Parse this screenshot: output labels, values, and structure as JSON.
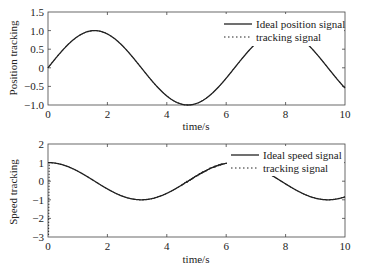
{
  "chart_data": [
    {
      "type": "line",
      "title": "",
      "xlabel": "time/s",
      "ylabel": "Position tracking",
      "xlim": [
        0,
        10
      ],
      "ylim": [
        -1.0,
        1.5
      ],
      "xticks": [
        "0",
        "2",
        "4",
        "6",
        "8",
        "10"
      ],
      "yticks": [
        "1.5",
        "1.0",
        "0.5",
        "0",
        "−0.5",
        "−1.0"
      ],
      "grid": false,
      "legend_position": "upper right",
      "x": [
        0,
        0.5,
        1,
        1.5,
        2,
        2.5,
        3,
        3.5,
        4,
        4.5,
        5,
        5.5,
        6,
        6.5,
        7,
        7.5,
        8,
        8.5,
        9,
        9.5,
        10
      ],
      "series": [
        {
          "name": "Ideal position signal",
          "style": "solid",
          "values": [
            0,
            0.48,
            0.84,
            1.0,
            0.91,
            0.6,
            0.14,
            -0.35,
            -0.76,
            -0.98,
            -0.96,
            -0.71,
            -0.28,
            0.22,
            0.66,
            0.94,
            0.99,
            0.8,
            0.41,
            -0.08,
            -0.54
          ]
        },
        {
          "name": "tracking signal",
          "style": "dotted",
          "values": [
            0,
            0.48,
            0.84,
            1.0,
            0.91,
            0.6,
            0.14,
            -0.35,
            -0.76,
            -0.98,
            -0.96,
            -0.71,
            -0.28,
            0.22,
            0.66,
            0.94,
            0.99,
            0.8,
            0.41,
            -0.08,
            -0.54
          ]
        }
      ]
    },
    {
      "type": "line",
      "title": "",
      "xlabel": "time/s",
      "ylabel": "Speed tracking",
      "xlim": [
        0,
        10
      ],
      "ylim": [
        -3,
        2
      ],
      "xticks": [
        "0",
        "2",
        "4",
        "6",
        "8",
        "10"
      ],
      "yticks": [
        "2",
        "1",
        "0",
        "−1",
        "−2",
        "−3"
      ],
      "grid": false,
      "legend_position": "upper right",
      "x": [
        0,
        0.5,
        1,
        1.5,
        2,
        2.5,
        3,
        3.5,
        4,
        4.5,
        5,
        5.5,
        6,
        6.5,
        7,
        7.5,
        8,
        8.5,
        9,
        9.5,
        10
      ],
      "series": [
        {
          "name": "Ideal speed signal",
          "style": "solid",
          "values": [
            1.0,
            0.88,
            0.54,
            0.07,
            -0.42,
            -0.8,
            -0.99,
            -0.94,
            -0.65,
            -0.21,
            0.28,
            0.71,
            0.96,
            0.98,
            0.75,
            0.35,
            -0.15,
            -0.6,
            -0.91,
            -1.0,
            -0.84
          ]
        },
        {
          "name": "tracking signal",
          "style": "dotted",
          "values": [
            -2.9,
            0.88,
            0.54,
            0.07,
            -0.42,
            -0.8,
            -0.99,
            -0.94,
            -0.65,
            -0.21,
            0.28,
            0.71,
            0.96,
            0.98,
            0.75,
            0.35,
            -0.15,
            -0.6,
            -0.91,
            -1.0,
            -0.84
          ]
        }
      ],
      "annotations": [
        "tracking signal starts near -3 at t=0 and rises steeply to 1",
        "noisy tracking around t=4.5-6"
      ]
    }
  ],
  "plot1": {
    "ylabel": "Position tracking",
    "xlabel": "time/s",
    "legend": [
      "Ideal position signal",
      "tracking signal"
    ],
    "xticks": [
      "0",
      "2",
      "4",
      "6",
      "8",
      "10"
    ],
    "yticks": [
      "1.5",
      "1.0",
      "0.5",
      "0",
      "−0.5",
      "−1.0"
    ]
  },
  "plot2": {
    "ylabel": "Speed tracking",
    "xlabel": "time/s",
    "legend": [
      "Ideal speed signal",
      "tracking signal"
    ],
    "xticks": [
      "0",
      "2",
      "4",
      "6",
      "8",
      "10"
    ],
    "yticks": [
      "2",
      "1",
      "0",
      "−1",
      "−2",
      "−3"
    ]
  }
}
